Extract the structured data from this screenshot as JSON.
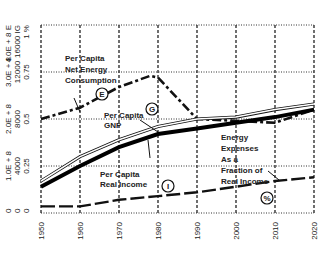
{
  "chart_data": {
    "type": "line",
    "title": "",
    "xlabel": "",
    "ylabel": "",
    "x": [
      1950,
      1960,
      1970,
      1980,
      1990,
      2000,
      2010,
      2020
    ],
    "xlim": [
      1950,
      2020
    ],
    "ylim": [
      0,
      1
    ],
    "grid": true,
    "y_axes": [
      {
        "unit": "E",
        "ticks": [
          "0",
          "1.0E + 8",
          "2.0E + 8",
          "3.0E + 8",
          "4.0E + 8"
        ]
      },
      {
        "unit": "IG",
        "ticks": [
          "0",
          "4000",
          "8000",
          "12000",
          "16000"
        ]
      },
      {
        "unit": "%",
        "ticks": [
          "0",
          "0.25",
          "0.5",
          "0.75",
          "1"
        ]
      }
    ],
    "x_ticks": [
      "1950",
      "1960",
      "1970",
      "1980",
      "1990",
      "2000",
      "2010",
      "2020"
    ],
    "series": [
      {
        "name": "Per Capita Net Energy Consumption",
        "marker": "E",
        "style": "dash-bold",
        "x": [
          1950,
          1960,
          1970,
          1978,
          1980,
          1990,
          2000,
          2010,
          2020
        ],
        "values": [
          0.5,
          0.56,
          0.67,
          0.73,
          0.72,
          0.5,
          0.49,
          0.48,
          0.55
        ]
      },
      {
        "name": "Per Capita GNP",
        "marker": "G",
        "style": "double-thin",
        "x": [
          1950,
          1960,
          1970,
          1980,
          1990,
          2000,
          2010,
          2020
        ],
        "values": [
          0.17,
          0.3,
          0.39,
          0.46,
          0.5,
          0.51,
          0.55,
          0.58
        ]
      },
      {
        "name": "Per Capita Real Income",
        "marker": "I",
        "style": "solid-thick",
        "x": [
          1950,
          1960,
          1970,
          1980,
          1990,
          2000,
          2010,
          2020
        ],
        "values": [
          0.14,
          0.25,
          0.35,
          0.42,
          0.45,
          0.48,
          0.51,
          0.55
        ]
      },
      {
        "name": "Energy Expenses As a Fraction of Real Income",
        "marker": "%",
        "style": "dash-solid",
        "x": [
          1950,
          1960,
          1970,
          1980,
          1990,
          2000,
          2010,
          2020
        ],
        "values": [
          0.035,
          0.035,
          0.07,
          0.09,
          0.11,
          0.14,
          0.17,
          0.19
        ]
      }
    ],
    "annotations": [
      {
        "text": [
          "Per Capita",
          "Net Energy",
          "Consumption"
        ],
        "marker": "E"
      },
      {
        "text": [
          "Per Capita",
          "GNP"
        ],
        "marker": "G"
      },
      {
        "text": [
          "Per Capita",
          "Real Income"
        ],
        "marker": "I"
      },
      {
        "text": [
          "Energy",
          "Expenses",
          "As a",
          "Fraction of",
          "Real Income"
        ],
        "marker": "%"
      }
    ]
  }
}
